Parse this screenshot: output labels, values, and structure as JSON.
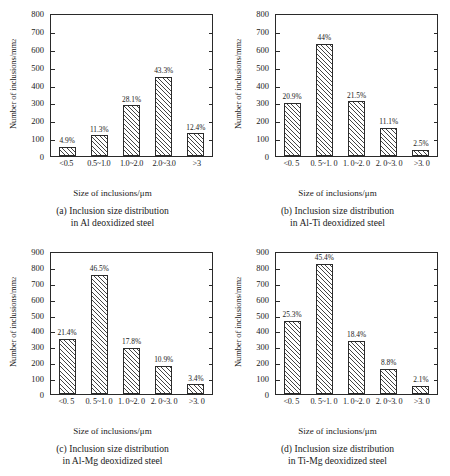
{
  "figure": {
    "background": "#ffffff",
    "axis_color": "#2a2a2a",
    "bar_edge_color": "#2b2b2b",
    "bar_hatch": "diagonal-45",
    "ylabel": "Number of inclusions/mm",
    "ylabel_superscript": "2",
    "xlabel": "Size of inclusions/μm"
  },
  "chart_data": [
    {
      "type": "bar",
      "panel": "a",
      "title": "(a) Inclusion size distribution",
      "subtitle": "in Al deoxidized steel",
      "caption_line1": "(a) Inclusion size distribution",
      "caption_line2": "in Al deoxidized steel",
      "xlabel": "Size of inclusions/μm",
      "ylabel": "Number of inclusions/mm²",
      "categories": [
        "<0.5",
        "0.5~1.0",
        "1.0~2.0",
        "2.0~3.0",
        ">3"
      ],
      "values": [
        50,
        115,
        283,
        440,
        126
      ],
      "data_labels": [
        "4.9%",
        "11.3%",
        "28.1%",
        "43.3%",
        "12.4%"
      ],
      "ylim": [
        0,
        800
      ],
      "yticks": [
        0,
        100,
        200,
        300,
        400,
        500,
        600,
        700,
        800
      ],
      "grid": false,
      "legend": "none"
    },
    {
      "type": "bar",
      "panel": "b",
      "title": "(b) Inclusion size distribution",
      "subtitle": "in Al-Ti deoxidized steel",
      "caption_line1": "(b) Inclusion size distribution",
      "caption_line2": "in Al-Ti deoxidized steel",
      "xlabel": "Size of inclusions/μm",
      "ylabel": "Number of inclusions/mm²",
      "categories": [
        "<0. 5",
        "0. 5~1. 0",
        "1. 0~2. 0",
        "2. 0~3. 0",
        ">3. 0"
      ],
      "values": [
        297,
        625,
        305,
        158,
        35
      ],
      "data_labels": [
        "20.9%",
        "44%",
        "21.5%",
        "11.1%",
        "2.5%"
      ],
      "ylim": [
        0,
        800
      ],
      "yticks": [
        0,
        100,
        200,
        300,
        400,
        500,
        600,
        700,
        800
      ],
      "grid": false,
      "legend": "none"
    },
    {
      "type": "bar",
      "panel": "c",
      "title": "(c) Inclusion size distribution",
      "subtitle": "in Al-Mg deoxidized steel",
      "caption_line1": "(c) Inclusion size distribution",
      "caption_line2": "in Al-Mg deoxidized steel",
      "xlabel": "Size of inclusions/μm",
      "ylabel": "Number of inclusions/mm²",
      "categories": [
        "<0. 5",
        "0. 5~1. 0",
        "1. 0~2. 0",
        "2. 0~3. 0",
        ">3. 0"
      ],
      "values": [
        345,
        750,
        288,
        175,
        60
      ],
      "data_labels": [
        "21.4%",
        "46.5%",
        "17.8%",
        "10.9%",
        "3.4%"
      ],
      "ylim": [
        0,
        900
      ],
      "yticks": [
        0,
        100,
        200,
        300,
        400,
        500,
        600,
        700,
        800,
        900
      ],
      "grid": false,
      "legend": "none"
    },
    {
      "type": "bar",
      "panel": "d",
      "title": "(d) Inclusion size distribution",
      "subtitle": "in Ti-Mg deoxidized steel",
      "caption_line1": "(d) Inclusion size distribution",
      "caption_line2": "in Ti-Mg deoxidized steel",
      "xlabel": "Size of inclusions/μm",
      "ylabel": "Number of inclusions/mm²",
      "categories": [
        "<0. 5",
        "0. 5~1. 0",
        "1. 0~2. 0",
        "2. 0~3. 0",
        ">3. 0"
      ],
      "values": [
        460,
        818,
        335,
        160,
        50
      ],
      "data_labels": [
        "25.3%",
        "45.4%",
        "18.4%",
        "8.8%",
        "2.1%"
      ],
      "ylim": [
        0,
        900
      ],
      "yticks": [
        0,
        100,
        200,
        300,
        400,
        500,
        600,
        700,
        800,
        900
      ],
      "grid": false,
      "legend": "none"
    }
  ]
}
